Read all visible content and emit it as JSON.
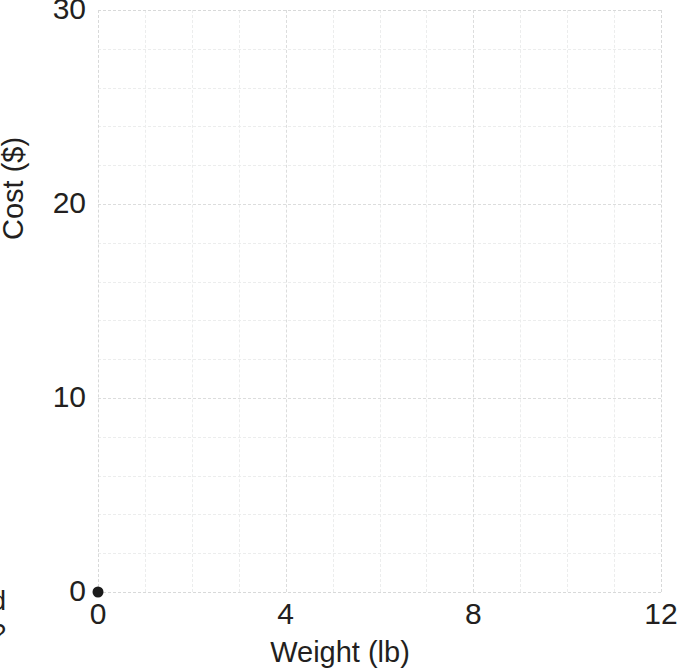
{
  "chart_data": {
    "type": "scatter",
    "title": "",
    "xlabel": "Weight (lb)",
    "ylabel": "Cost ($)",
    "xlim": [
      0,
      12
    ],
    "ylim": [
      0,
      30
    ],
    "xticks": [
      0,
      4,
      8,
      12
    ],
    "yticks": [
      0,
      10,
      20,
      30
    ],
    "xtick_labels": [
      "0",
      "4",
      "8",
      "12"
    ],
    "ytick_labels": [
      "0",
      "10",
      "20",
      "30"
    ],
    "x_minor_step": 1,
    "y_minor_step": 2,
    "grid": true,
    "grid_style": "dashed",
    "grid_color": "#dcdddd",
    "minor_grid_color": "#eceded",
    "legend": null,
    "points": [
      {
        "x": 0,
        "y": 0,
        "label": "",
        "color": "#1b1b1b"
      }
    ],
    "series": [
      {
        "name": "",
        "x": [
          0
        ],
        "y": [
          0
        ],
        "marker": "filled-circle",
        "color": "#1b1b1b"
      }
    ],
    "annotations": []
  },
  "margin_text": {
    "line1": "d",
    "line2": "?"
  },
  "colors": {
    "text": "#231f20",
    "point": "#1b1b1b",
    "major_grid": "#dcdddd",
    "minor_grid": "#eceded",
    "background": "#ffffff"
  }
}
